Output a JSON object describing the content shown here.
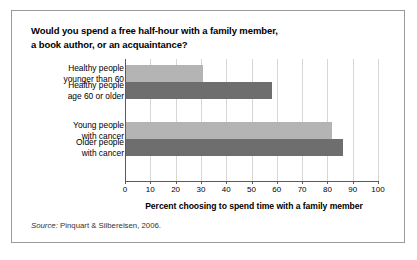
{
  "figure": {
    "title_line1": "Would you spend a free half-hour with a family member,",
    "title_line2": "a book author, or an acquaintance?",
    "source_word": "Source:",
    "source_text": " Pinquart & Silbereisen, 2006."
  },
  "colors": {
    "bar_light": "#b4b4b4",
    "bar_dark": "#6e6e6e",
    "gridline": "#d7d7d7",
    "axis": "#5a5a5a",
    "border": "#9a9a9a",
    "text": "#000000"
  },
  "chart_data": {
    "type": "bar",
    "orientation": "horizontal",
    "title": "Would you spend a free half-hour with a family member, a book author, or an acquaintance?",
    "xlabel": "Percent choosing to spend time with a family member",
    "ylabel": "",
    "xlim": [
      0,
      100
    ],
    "xticks": [
      0,
      10,
      20,
      30,
      40,
      50,
      60,
      70,
      80,
      90,
      100
    ],
    "grid": true,
    "legend": "none",
    "categories": [
      "Healthy people younger than 60",
      "Healthy people age 60 or older",
      "Young people with cancer",
      "Older people with cancer"
    ],
    "category_lines": [
      [
        "Healthy people",
        "younger than 60"
      ],
      [
        "Healthy people",
        "age 60 or older"
      ],
      [
        "Young people",
        "with cancer"
      ],
      [
        "Older people",
        "with cancer"
      ]
    ],
    "values": [
      31,
      58,
      82,
      86
    ],
    "bar_colors": [
      "#b4b4b4",
      "#6e6e6e",
      "#b4b4b4",
      "#6e6e6e"
    ],
    "source": "Source: Pinquart & Silbereisen, 2006."
  }
}
